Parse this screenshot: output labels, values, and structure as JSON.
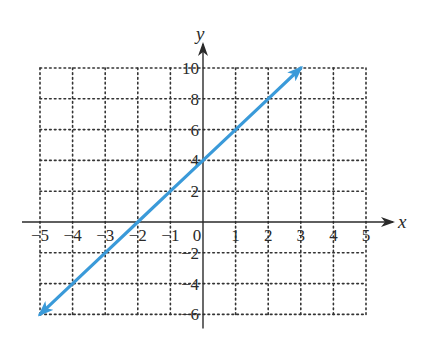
{
  "chart_data": {
    "type": "line",
    "title": "",
    "xlabel": "x",
    "ylabel": "y",
    "xlim": [
      -5,
      5
    ],
    "ylim": [
      -6,
      10
    ],
    "grid": true,
    "x_ticks": [
      -5,
      -4,
      -3,
      -2,
      -1,
      0,
      1,
      2,
      3,
      4,
      5
    ],
    "y_ticks": [
      -6,
      -4,
      -2,
      2,
      4,
      6,
      8,
      10
    ],
    "x_tick_labels": [
      "−5",
      "−4",
      "−3",
      "−2",
      "−1",
      "0",
      "1",
      "2",
      "3",
      "4",
      "5"
    ],
    "y_tick_labels": [
      "−6",
      "−4",
      "−2",
      "2",
      "4",
      "6",
      "8",
      "10"
    ],
    "series": [
      {
        "name": "y = 2x + 4",
        "color": "#3a9ad9",
        "arrows": "both",
        "x": [
          -5,
          -4,
          -3,
          -2,
          -1,
          0,
          1,
          2,
          3
        ],
        "y": [
          -6,
          -4,
          -2,
          0,
          2,
          4,
          6,
          8,
          10
        ]
      }
    ],
    "legend": null
  }
}
